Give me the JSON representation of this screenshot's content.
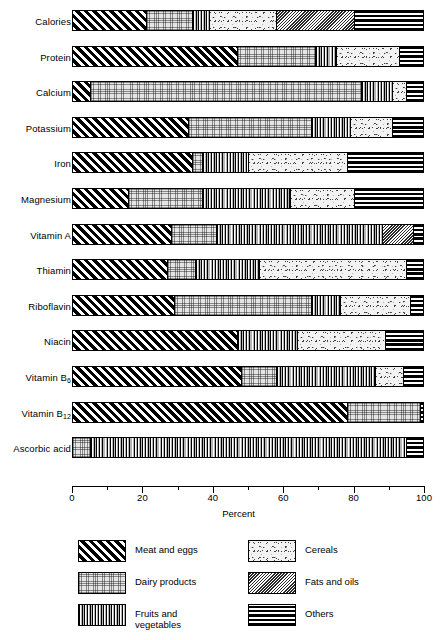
{
  "chart_data": {
    "type": "bar",
    "orientation": "horizontal",
    "stacked": true,
    "stack_total": 100,
    "title": "",
    "xlabel": "Percent",
    "ylabel": "",
    "xlim": [
      0,
      100
    ],
    "xticks": [
      0,
      20,
      40,
      60,
      80,
      100
    ],
    "xtick_labels": [
      "0",
      "20",
      "40",
      "60",
      "80",
      "100"
    ],
    "minor_ticks": [
      10,
      30,
      50,
      70,
      90
    ],
    "grid": false,
    "legend_position": "bottom",
    "categories": [
      "Calories",
      "Protein",
      "Calcium",
      "Potassium",
      "Iron",
      "Magnesium",
      "Vitamin A",
      "Thiamin",
      "Riboflavin",
      "Niacin",
      "Vitamin B6",
      "Vitamin B12",
      "Ascorbic acid"
    ],
    "category_labels_html": [
      "Calories",
      "Protein",
      "Calcium",
      "Potassium",
      "Iron",
      "Magnesium",
      "Vitamin A",
      "Thiamin",
      "Riboflavin",
      "Niacin",
      "Vitamin B<sub>6</sub>",
      "Vitamin B<sub>12</sub>",
      "Ascorbic acid"
    ],
    "series": [
      {
        "name": "Meat and eggs",
        "pattern": "diagonal-hatch-black",
        "values": [
          21,
          47,
          5,
          33,
          34,
          16,
          28,
          27,
          29,
          47,
          48,
          78,
          0
        ]
      },
      {
        "name": "Dairy products",
        "pattern": "fine-dot-grid",
        "values": [
          13,
          22,
          77,
          35,
          3,
          21,
          13,
          8,
          39,
          0,
          10,
          21,
          5
        ]
      },
      {
        "name": "Fruits and vegetables",
        "pattern": "vertical-lines",
        "values": [
          5,
          6,
          9,
          11,
          13,
          25,
          47,
          18,
          8,
          17,
          28,
          0,
          90
        ]
      },
      {
        "name": "Cereals",
        "pattern": "coarse-stipple",
        "values": [
          19,
          18,
          4,
          12,
          28,
          18,
          0,
          42,
          20,
          25,
          8,
          0,
          0
        ]
      },
      {
        "name": "Fats and oils",
        "pattern": "fine-diagonal-grey",
        "values": [
          22,
          0,
          0,
          0,
          0,
          0,
          9,
          0,
          0,
          0,
          0,
          0,
          0
        ]
      },
      {
        "name": "Others",
        "pattern": "horizontal-lines-black",
        "values": [
          20,
          7,
          5,
          9,
          22,
          20,
          3,
          5,
          4,
          11,
          6,
          1,
          5
        ]
      }
    ],
    "stack_boundaries": {
      "Calories": [
        21,
        34,
        39,
        58,
        80,
        100
      ],
      "Protein": [
        47,
        69,
        75,
        93,
        93,
        100
      ],
      "Calcium": [
        5,
        82,
        91,
        95,
        95,
        100
      ],
      "Potassium": [
        33,
        68,
        79,
        91,
        91,
        100
      ],
      "Iron": [
        34,
        37,
        50,
        78,
        78,
        100
      ],
      "Magnesium": [
        16,
        37,
        62,
        80,
        80,
        100
      ],
      "Vitamin A": [
        28,
        41,
        88,
        88,
        97,
        100
      ],
      "Thiamin": [
        27,
        35,
        53,
        95,
        95,
        100
      ],
      "Riboflavin": [
        29,
        68,
        76,
        96,
        96,
        100
      ],
      "Niacin": [
        47,
        47,
        64,
        89,
        89,
        100
      ],
      "Vitamin B6": [
        48,
        58,
        86,
        94,
        94,
        100
      ],
      "Vitamin B12": [
        78,
        99,
        99,
        99,
        99,
        100
      ],
      "Ascorbic acid": [
        0,
        5,
        95,
        95,
        95,
        100
      ]
    },
    "legend_entries": [
      {
        "label": "Meat and eggs",
        "pattern": "diagonal-hatch-black",
        "column": 0,
        "row": 0
      },
      {
        "label": "Dairy products",
        "pattern": "fine-dot-grid",
        "column": 0,
        "row": 1
      },
      {
        "label": "Fruits and\nvegetables",
        "pattern": "vertical-lines",
        "column": 0,
        "row": 2
      },
      {
        "label": "Cereals",
        "pattern": "coarse-stipple",
        "column": 1,
        "row": 0
      },
      {
        "label": "Fats and oils",
        "pattern": "fine-diagonal-grey",
        "column": 1,
        "row": 1
      },
      {
        "label": "Others",
        "pattern": "horizontal-lines-black",
        "column": 1,
        "row": 2
      }
    ],
    "colors": {
      "ink": "#000000",
      "background": "#ffffff"
    }
  }
}
